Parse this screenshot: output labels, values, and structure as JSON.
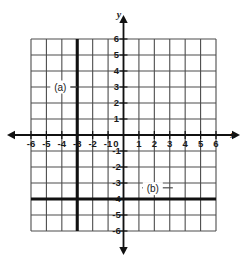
{
  "chart_data": {
    "type": "line",
    "title": "",
    "xlabel": "x",
    "ylabel": "y",
    "xlim": [
      -6,
      6
    ],
    "ylim": [
      -6,
      6
    ],
    "grid": true,
    "grid_step": 1,
    "legend": "none",
    "x_tick_labels": [
      "-6",
      "-5",
      "-4",
      "-3",
      "-2",
      "-1",
      "0",
      "1",
      "2",
      "3",
      "4",
      "5",
      "6"
    ],
    "y_tick_labels": [
      "6",
      "5",
      "4",
      "3",
      "2",
      "1",
      "-1",
      "-2",
      "-3",
      "-4",
      "-5",
      "-6"
    ],
    "origin_label": "0",
    "series": [
      {
        "name": "(a)",
        "kind": "vertical-line",
        "equation_value": -3,
        "label": "(a)",
        "label_x": -4.1,
        "label_y": 3,
        "leader_from_x": -3.6,
        "leader_to_x": -3.0,
        "leader_y": 3
      },
      {
        "name": "(b)",
        "kind": "horizontal-line",
        "equation_value": -4,
        "label": "(b)",
        "label_x": 1.9,
        "label_y": -3.35,
        "leader_from_x": 1.2,
        "leader_to_x": 3.2,
        "leader_y": -3.3
      }
    ],
    "axis_arrows": [
      "left",
      "right",
      "up",
      "down"
    ]
  },
  "geometry": {
    "left": 31,
    "right": 216,
    "top": 39,
    "bottom": 231,
    "origin_x": 123.5,
    "origin_y": 135,
    "unit_x": 15.417,
    "unit_y": 16
  },
  "colors": {
    "background": "#ffffff",
    "grid": "#4d4d4d",
    "axis": "#111111",
    "bold_line": "#111111",
    "text": "#1a1a1a"
  },
  "icons": {
    "arrow_left": "arrow-left-icon",
    "arrow_right": "arrow-right-icon",
    "arrow_up": "arrow-up-icon",
    "arrow_down": "arrow-down-icon"
  }
}
